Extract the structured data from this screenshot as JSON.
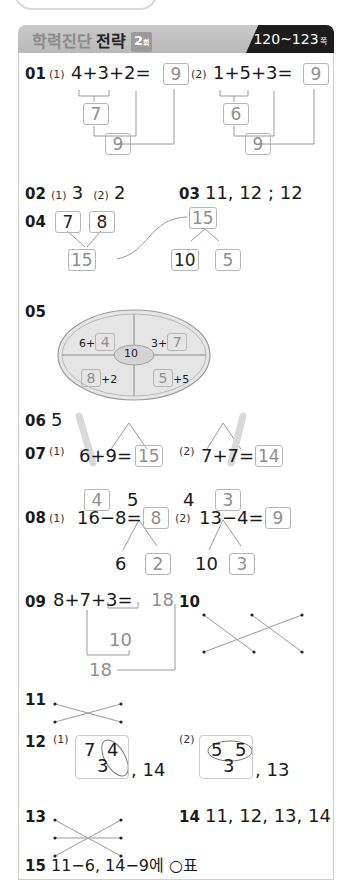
{
  "header": {
    "title_light": "학력진단",
    "title_bold": "전략",
    "round": "2",
    "round_unit": "회",
    "pages": "120~123",
    "pages_unit": "쪽"
  },
  "q01": {
    "num": "01",
    "p1": {
      "label": "(1)",
      "expr": "4+3+2=",
      "answer": "9",
      "partial": "7",
      "total": "9"
    },
    "p2": {
      "label": "(2)",
      "expr": "1+5+3=",
      "answer": "9",
      "partial": "6",
      "total": "9"
    }
  },
  "q02": {
    "num": "02",
    "p1_label": "(1)",
    "p1": "3",
    "p2_label": "(2)",
    "p2": "2"
  },
  "q03": {
    "num": "03",
    "text": "11, 12 ; 12"
  },
  "q04": {
    "num": "04",
    "a": "7",
    "b": "8",
    "sum": "15",
    "top": "15",
    "split_a": "10",
    "split_b": "5"
  },
  "q05": {
    "num": "05",
    "center": "10",
    "tl_prefix": "6+",
    "tl_box": "4",
    "tr_prefix": "3+",
    "tr_box": "7",
    "bl_box": "8",
    "bl_suffix": "+2",
    "br_box": "5",
    "br_suffix": "+5"
  },
  "q06": {
    "num": "06",
    "text": "5"
  },
  "q07": {
    "num": "07",
    "p1": {
      "label": "(1)",
      "expr": "6+9=",
      "answer": "15",
      "left": "4",
      "right": "5"
    },
    "p2": {
      "label": "(2)",
      "expr": "7+7=",
      "answer": "14",
      "left": "4",
      "right": "3"
    }
  },
  "q08": {
    "num": "08",
    "p1": {
      "label": "(1)",
      "expr": "16−8=",
      "answer": "8",
      "left": "6",
      "right": "2"
    },
    "p2": {
      "label": "(2)",
      "expr": "13−4=",
      "answer": "9",
      "left": "10",
      "right": "3"
    }
  },
  "q09": {
    "num": "09",
    "expr": "8+7+3=",
    "answer": "18",
    "partial": "10",
    "total": "18"
  },
  "q10": {
    "num": "10"
  },
  "q11": {
    "num": "11"
  },
  "q12": {
    "num": "12",
    "p1": {
      "label": "(1)",
      "a": "7",
      "b": "4",
      "c": "3",
      "answer": ", 14"
    },
    "p2": {
      "label": "(2)",
      "a": "5",
      "b": "5",
      "c": "3",
      "answer": ", 13"
    }
  },
  "q13": {
    "num": "13"
  },
  "q14": {
    "num": "14",
    "text": "11, 12, 13, 14"
  },
  "q15": {
    "num": "15",
    "text": "11−6, 14−9에 ○표"
  },
  "q16": {
    "num": "16",
    "text": "15개"
  },
  "q17": {
    "num": "17",
    "text": "8개"
  },
  "q18": {
    "num": "18",
    "text": "7+8=15, 15쪽"
  }
}
